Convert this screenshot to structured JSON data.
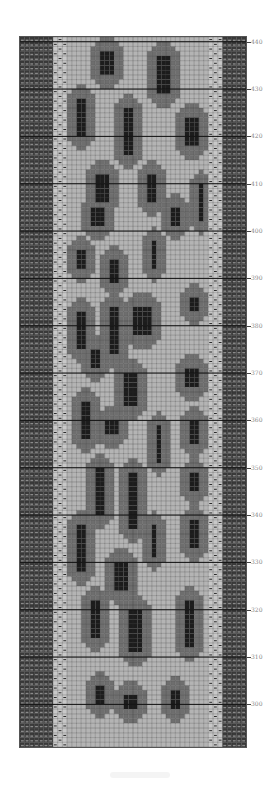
{
  "chart": {
    "title": "",
    "type": "knitting-colorwork-chart",
    "columns": 48,
    "rows": 150,
    "first_row": 291,
    "colors": {
      "background": "#b4b4b4",
      "medium": "#6e6e6e",
      "dark": "#1c1c1c",
      "border_band": "#3a3a3a",
      "border_cell_light": "#8a8a8a",
      "dash_band": "#c8c8c8",
      "grid_line": "#303030"
    },
    "bands": {
      "left_dark_cols": 7,
      "left_dash_cols": 3,
      "right_dash_cols": 3,
      "right_dark_cols": 5
    },
    "row_labels": [
      "440",
      "430",
      "420",
      "410",
      "400",
      "390",
      "380",
      "370",
      "360",
      "350",
      "340",
      "330",
      "320",
      "310",
      "300"
    ]
  },
  "chart_data": {
    "type": "heatmap",
    "title": "",
    "xlabel": "",
    "ylabel": "Row",
    "y_ticks": [
      300,
      310,
      320,
      330,
      340,
      350,
      360,
      370,
      380,
      390,
      400,
      410,
      420,
      430,
      440
    ],
    "ylim": [
      291,
      441
    ],
    "grid": true,
    "legend": [],
    "motif": "leopard spots (dark core with medium-gray halo on light background)",
    "spots": [
      {
        "col": 17,
        "row": 438,
        "w": 3,
        "h": 5
      },
      {
        "col": 29,
        "row": 437,
        "w": 3,
        "h": 8
      },
      {
        "col": 12,
        "row": 428,
        "w": 2,
        "h": 8
      },
      {
        "col": 22,
        "row": 426,
        "w": 2,
        "h": 10
      },
      {
        "col": 35,
        "row": 424,
        "w": 3,
        "h": 6
      },
      {
        "col": 16,
        "row": 412,
        "w": 3,
        "h": 6
      },
      {
        "col": 27,
        "row": 412,
        "w": 2,
        "h": 6
      },
      {
        "col": 38,
        "row": 410,
        "w": 1,
        "h": 8
      },
      {
        "col": 15,
        "row": 405,
        "w": 3,
        "h": 4
      },
      {
        "col": 32,
        "row": 405,
        "w": 2,
        "h": 4
      },
      {
        "col": 12,
        "row": 396,
        "w": 2,
        "h": 4
      },
      {
        "col": 19,
        "row": 394,
        "w": 2,
        "h": 5
      },
      {
        "col": 28,
        "row": 398,
        "w": 1,
        "h": 6
      },
      {
        "col": 12,
        "row": 383,
        "w": 2,
        "h": 8
      },
      {
        "col": 19,
        "row": 384,
        "w": 2,
        "h": 10
      },
      {
        "col": 24,
        "row": 384,
        "w": 4,
        "h": 6
      },
      {
        "col": 36,
        "row": 386,
        "w": 2,
        "h": 3
      },
      {
        "col": 15,
        "row": 375,
        "w": 2,
        "h": 4
      },
      {
        "col": 22,
        "row": 370,
        "w": 3,
        "h": 7
      },
      {
        "col": 35,
        "row": 371,
        "w": 3,
        "h": 4
      },
      {
        "col": 13,
        "row": 364,
        "w": 2,
        "h": 8
      },
      {
        "col": 18,
        "row": 360,
        "w": 3,
        "h": 3
      },
      {
        "col": 29,
        "row": 359,
        "w": 1,
        "h": 8
      },
      {
        "col": 36,
        "row": 360,
        "w": 2,
        "h": 5
      },
      {
        "col": 16,
        "row": 350,
        "w": 2,
        "h": 10
      },
      {
        "col": 23,
        "row": 349,
        "w": 2,
        "h": 12
      },
      {
        "col": 36,
        "row": 349,
        "w": 2,
        "h": 4
      },
      {
        "col": 12,
        "row": 338,
        "w": 2,
        "h": 10
      },
      {
        "col": 28,
        "row": 338,
        "w": 1,
        "h": 7
      },
      {
        "col": 36,
        "row": 339,
        "w": 2,
        "h": 6
      },
      {
        "col": 20,
        "row": 330,
        "w": 3,
        "h": 6
      },
      {
        "col": 15,
        "row": 322,
        "w": 2,
        "h": 8
      },
      {
        "col": 23,
        "row": 320,
        "w": 3,
        "h": 9
      },
      {
        "col": 35,
        "row": 322,
        "w": 2,
        "h": 10
      },
      {
        "col": 16,
        "row": 304,
        "w": 2,
        "h": 4
      },
      {
        "col": 22,
        "row": 302,
        "w": 3,
        "h": 3
      },
      {
        "col": 32,
        "row": 303,
        "w": 2,
        "h": 4
      }
    ]
  },
  "footer": {}
}
